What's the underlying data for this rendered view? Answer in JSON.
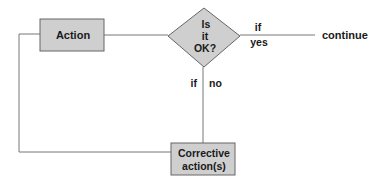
{
  "diagram": {
    "type": "flowchart",
    "nodes": {
      "action": {
        "label": "Action",
        "shape": "rectangle"
      },
      "decision": {
        "label_lines": [
          "Is",
          "it",
          "OK?"
        ],
        "shape": "diamond"
      },
      "corrective": {
        "label_lines": [
          "Corrective",
          "action(s)"
        ],
        "shape": "rectangle"
      },
      "continue": {
        "label": "continue",
        "shape": "text"
      }
    },
    "edges": {
      "yes": {
        "label_lines": [
          "if",
          "yes"
        ],
        "from": "decision",
        "to": "continue"
      },
      "no": {
        "label_left": "if",
        "label_right": "no",
        "from": "decision",
        "to": "corrective"
      },
      "loop": {
        "from": "corrective",
        "to": "action"
      },
      "action_to_decision": {
        "from": "action",
        "to": "decision"
      }
    },
    "colors": {
      "node_fill": "#cfcfcf",
      "node_stroke": "#666666",
      "line": "#777777",
      "text": "#1a1a1a"
    }
  }
}
